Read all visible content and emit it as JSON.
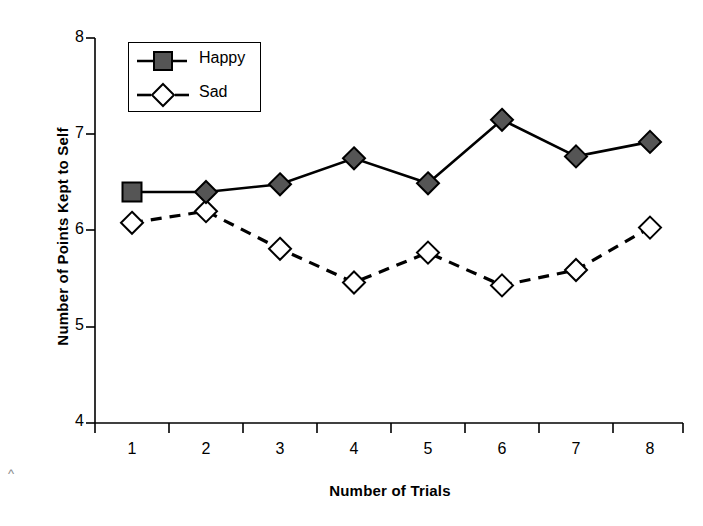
{
  "chart_data": {
    "type": "line",
    "title": "",
    "xlabel": "Number of Trials",
    "ylabel": "Number of Points Kept to Self",
    "categories": [
      "1",
      "2",
      "3",
      "4",
      "5",
      "6",
      "7",
      "8"
    ],
    "x": [
      1,
      2,
      3,
      4,
      5,
      6,
      7,
      8
    ],
    "xlim": [
      0.5,
      8.5
    ],
    "ylim": [
      4,
      8
    ],
    "xticks": [
      "1",
      "2",
      "3",
      "4",
      "5",
      "6",
      "7",
      "8"
    ],
    "yticks": [
      "4",
      "5",
      "6",
      "7",
      "8"
    ],
    "grid": false,
    "legend_position": "top-left",
    "series": [
      {
        "name": "Happy",
        "values": [
          6.4,
          6.4,
          6.48,
          6.75,
          6.49,
          7.15,
          6.77,
          6.92
        ],
        "line_style": "solid",
        "marker": "square-then-diamond",
        "marker_fill": "#555555",
        "marker_stroke": "#000000",
        "line_color": "#000000"
      },
      {
        "name": "Sad",
        "values": [
          6.08,
          6.2,
          5.81,
          5.46,
          5.77,
          5.43,
          5.59,
          6.03
        ],
        "line_style": "dashed",
        "marker": "diamond",
        "marker_fill": "#ffffff",
        "marker_stroke": "#000000",
        "line_color": "#000000"
      }
    ]
  },
  "legend": {
    "items": [
      {
        "label": "Happy",
        "marker": "filled-square",
        "line": "solid"
      },
      {
        "label": "Sad",
        "marker": "open-diamond",
        "line": "dashed"
      }
    ]
  },
  "colors": {
    "axis": "#000000",
    "happy_fill": "#555555",
    "sad_fill": "#ffffff",
    "background": "#ffffff"
  },
  "corner_mark": "^"
}
